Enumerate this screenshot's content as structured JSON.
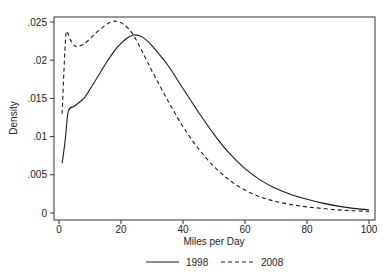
{
  "chart_data": {
    "type": "line",
    "title": "",
    "xlabel": "Miles per Day",
    "ylabel": "Density",
    "xlim": [
      0,
      100
    ],
    "ylim": [
      0,
      0.025
    ],
    "x_ticks": [
      0,
      20,
      40,
      60,
      80,
      100
    ],
    "x_tick_labels": [
      "0",
      "20",
      "40",
      "60",
      "80",
      "100"
    ],
    "y_ticks": [
      0,
      0.005,
      0.01,
      0.015,
      0.02,
      0.025
    ],
    "y_tick_labels": [
      "0",
      ".005",
      ".01",
      ".015",
      ".02",
      ".025"
    ],
    "grid": false,
    "legend_position": "bottom",
    "series": [
      {
        "name": "1998",
        "style": "solid",
        "x": [
          1,
          2,
          3,
          5,
          8,
          10,
          12,
          15,
          18,
          20,
          22,
          24,
          26,
          28,
          30,
          35,
          40,
          45,
          50,
          55,
          60,
          65,
          70,
          75,
          80,
          85,
          90,
          95,
          100
        ],
        "values": [
          0.0065,
          0.0095,
          0.0133,
          0.014,
          0.015,
          0.0162,
          0.0175,
          0.0195,
          0.0213,
          0.0222,
          0.0229,
          0.0233,
          0.0232,
          0.0227,
          0.0219,
          0.0194,
          0.0163,
          0.0132,
          0.0103,
          0.0078,
          0.0058,
          0.0043,
          0.0032,
          0.0024,
          0.0018,
          0.0013,
          0.0009,
          0.0006,
          0.0004
        ]
      },
      {
        "name": "2008",
        "style": "dashed",
        "x": [
          1,
          2,
          2.5,
          3.5,
          5,
          6,
          8,
          10,
          12,
          15,
          17.5,
          20,
          22,
          24,
          26,
          28,
          30,
          35,
          40,
          45,
          50,
          55,
          60,
          65,
          70,
          75,
          80,
          85,
          90,
          95,
          100
        ],
        "values": [
          0.013,
          0.022,
          0.0238,
          0.0228,
          0.0219,
          0.0218,
          0.0221,
          0.0228,
          0.0236,
          0.0246,
          0.0251,
          0.0249,
          0.0243,
          0.0233,
          0.0218,
          0.0202,
          0.0186,
          0.0148,
          0.0113,
          0.0084,
          0.0061,
          0.0043,
          0.003,
          0.0021,
          0.0015,
          0.0011,
          0.0008,
          0.0006,
          0.0004,
          0.0003,
          0.0002
        ]
      }
    ]
  }
}
